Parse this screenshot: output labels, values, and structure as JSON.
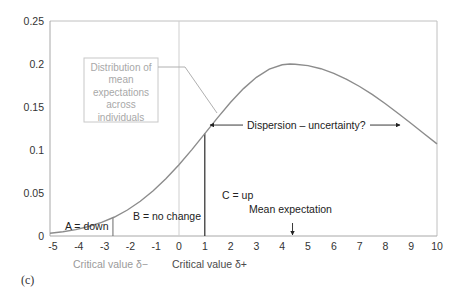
{
  "colors": {
    "curve": "#8c8c8c",
    "axis": "#a8a8a8",
    "frame": "#c0c0c0",
    "zero_line": "#cfcfcf",
    "critical_plus_line": "#2a2a2a",
    "critical_minus_line": "#6a6a6a",
    "callout_box": "#c8c8c8",
    "leader_line": "#b0b0b0",
    "text_dark": "#222222",
    "text_gray": "#a0a0a0"
  },
  "chart_data": {
    "type": "line",
    "title": "",
    "xlabel": "",
    "ylabel": "",
    "xlim": [
      -5,
      10
    ],
    "ylim": [
      0,
      0.25
    ],
    "grid": false,
    "legend": null,
    "x_ticks": [
      "-5",
      "-4",
      "-3",
      "-2",
      "-1",
      "0",
      "1",
      "2",
      "3",
      "4",
      "5",
      "6",
      "7",
      "8",
      "9",
      "10"
    ],
    "x_tick_values": [
      -5,
      -4,
      -3,
      -2,
      -1,
      0,
      1,
      2,
      3,
      4,
      5,
      6,
      7,
      8,
      9,
      10
    ],
    "y_ticks": [
      "0",
      "0.05",
      "0.1",
      "0.15",
      "0.2",
      "0.25"
    ],
    "y_tick_values": [
      0,
      0.05,
      0.1,
      0.15,
      0.2,
      0.25
    ],
    "series": [
      {
        "name": "Distribution of mean expectations across individuals",
        "x": [
          -5,
          -4.5,
          -4,
          -3.5,
          -3,
          -2.5,
          -2,
          -1.5,
          -1,
          -0.5,
          0,
          0.5,
          1,
          1.5,
          2,
          2.5,
          3,
          3.5,
          4,
          4.3,
          4.5,
          5,
          5.5,
          6,
          6.5,
          7,
          7.5,
          8,
          8.5,
          9,
          9.5,
          10
        ],
        "y": [
          0.0033,
          0.005,
          0.0075,
          0.011,
          0.0158,
          0.0221,
          0.0302,
          0.0403,
          0.0525,
          0.0668,
          0.0829,
          0.1005,
          0.1191,
          0.1377,
          0.1555,
          0.1714,
          0.1845,
          0.194,
          0.1991,
          0.2,
          0.1998,
          0.1981,
          0.1945,
          0.1892,
          0.1822,
          0.1738,
          0.1643,
          0.1537,
          0.1425,
          0.1308,
          0.1189,
          0.1071
        ]
      }
    ],
    "vertical_lines": [
      {
        "name": "critical-value-minus",
        "x": -2.56,
        "label": "Critical value δ−"
      },
      {
        "name": "zero",
        "x": 0
      },
      {
        "name": "critical-value-plus",
        "x": 1.0,
        "label": "Critical value δ+"
      }
    ],
    "mean_expectation_x": 4.4,
    "regions": [
      {
        "label": "A = down"
      },
      {
        "label": "B = no change"
      },
      {
        "label": "C = up"
      }
    ],
    "annotations": {
      "callout_lines": [
        "Distribution of",
        "mean",
        "expectations",
        "across",
        "individuals"
      ],
      "dispersion": "Dispersion – uncertainty?",
      "dispersion_range": [
        1.2,
        8.57
      ],
      "dispersion_y": 0.129,
      "mean_expectation": "Mean expectation",
      "critical_minus": "Critical value  δ−",
      "critical_plus": "Critical value  δ+",
      "panel_label": "(c)"
    }
  }
}
